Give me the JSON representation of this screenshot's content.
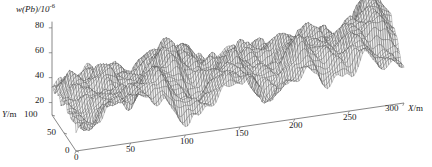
{
  "figure": {
    "name": "lead-concentration-surface-plot",
    "background_color": "#ffffff",
    "width": 432,
    "height": 167
  },
  "chart_data": {
    "type": "surface",
    "title": "",
    "subtitle": "",
    "zlabel_text": "w(Pb)/10",
    "zlabel_exponent": "-6",
    "zlabel_full": "w(Pb)/10⁻⁶",
    "xlabel": "X/m",
    "xlabel_italic_part": "X",
    "xlabel_unit_part": "/m",
    "ylabel": "Y/m",
    "ylabel_italic_part": "Y",
    "ylabel_unit_part": "/m",
    "x_ticks": [
      0,
      50,
      100,
      150,
      200,
      250,
      300
    ],
    "y_ticks": [
      0,
      50,
      100
    ],
    "z_ticks": [
      20,
      40,
      60,
      80
    ],
    "xlim": [
      0,
      300
    ],
    "ylim": [
      0,
      100
    ],
    "zlim": [
      10,
      85
    ],
    "grid": false,
    "legend": false,
    "mesh_color": "#4a4a4a",
    "axis_color": "#6a6a6a",
    "surface_fill": "#f2f2f2",
    "x_resolution": 150,
    "y_resolution": 40,
    "projection": {
      "origin_x": 76,
      "origin_y": 151,
      "x_axis_end_x": 404,
      "x_axis_end_y": 103,
      "y_axis_end_x": 52,
      "y_axis_end_y": 115,
      "z_pixels_per_unit": 1.245,
      "z_base_value": 10
    },
    "surface_peaks": [
      {
        "x": 285,
        "y": 60,
        "z": 82,
        "sigma_x": 14,
        "sigma_y": 22
      },
      {
        "x": 262,
        "y": 30,
        "z": 63,
        "sigma_x": 16,
        "sigma_y": 24
      },
      {
        "x": 228,
        "y": 55,
        "z": 56,
        "sigma_x": 20,
        "sigma_y": 26
      },
      {
        "x": 196,
        "y": 40,
        "z": 52,
        "sigma_x": 17,
        "sigma_y": 24
      },
      {
        "x": 168,
        "y": 65,
        "z": 48,
        "sigma_x": 16,
        "sigma_y": 25
      },
      {
        "x": 140,
        "y": 35,
        "z": 50,
        "sigma_x": 15,
        "sigma_y": 22
      },
      {
        "x": 118,
        "y": 70,
        "z": 58,
        "sigma_x": 13,
        "sigma_y": 20
      },
      {
        "x": 96,
        "y": 45,
        "z": 62,
        "sigma_x": 12,
        "sigma_y": 20
      },
      {
        "x": 72,
        "y": 25,
        "z": 55,
        "sigma_x": 13,
        "sigma_y": 22
      },
      {
        "x": 52,
        "y": 70,
        "z": 47,
        "sigma_x": 14,
        "sigma_y": 24
      },
      {
        "x": 30,
        "y": 40,
        "z": 44,
        "sigma_x": 15,
        "sigma_y": 26
      },
      {
        "x": 10,
        "y": 75,
        "z": 40,
        "sigma_x": 13,
        "sigma_y": 24
      },
      {
        "x": 308,
        "y": 20,
        "z": 45,
        "sigma_x": 12,
        "sigma_y": 20
      },
      {
        "x": 246,
        "y": 85,
        "z": 50,
        "sigma_x": 14,
        "sigma_y": 18
      },
      {
        "x": 210,
        "y": 15,
        "z": 46,
        "sigma_x": 13,
        "sigma_y": 18
      },
      {
        "x": 152,
        "y": 12,
        "z": 44,
        "sigma_x": 12,
        "sigma_y": 16
      },
      {
        "x": 86,
        "y": 88,
        "z": 46,
        "sigma_x": 12,
        "sigma_y": 16
      },
      {
        "x": 44,
        "y": 8,
        "z": 42,
        "sigma_x": 12,
        "sigma_y": 16
      }
    ],
    "surface_troughs": [
      {
        "x": 256,
        "y": 68,
        "z": -16,
        "sigma_x": 12,
        "sigma_y": 18
      },
      {
        "x": 182,
        "y": 28,
        "z": -14,
        "sigma_x": 13,
        "sigma_y": 20
      },
      {
        "x": 128,
        "y": 55,
        "z": -15,
        "sigma_x": 11,
        "sigma_y": 18
      },
      {
        "x": 60,
        "y": 50,
        "z": -17,
        "sigma_x": 11,
        "sigma_y": 18
      },
      {
        "x": 20,
        "y": 20,
        "z": -12,
        "sigma_x": 12,
        "sigma_y": 20
      },
      {
        "x": 296,
        "y": 88,
        "z": -13,
        "sigma_x": 11,
        "sigma_y": 16
      },
      {
        "x": 222,
        "y": 90,
        "z": -12,
        "sigma_x": 12,
        "sigma_y": 16
      },
      {
        "x": 104,
        "y": 15,
        "z": -13,
        "sigma_x": 11,
        "sigma_y": 16
      }
    ],
    "base_level": 32,
    "ripple": {
      "amplitude_x": 4.0,
      "wavelength_x": 26,
      "amplitude_y": 3.0,
      "wavelength_y": 34,
      "amplitude_fine": 1.6,
      "wavelength_fine": 13
    }
  },
  "zlabel": {
    "text": "w(Pb)/10",
    "exponent": "-6"
  },
  "axis_titles": {
    "x": "X/m",
    "y": "Y/m"
  }
}
